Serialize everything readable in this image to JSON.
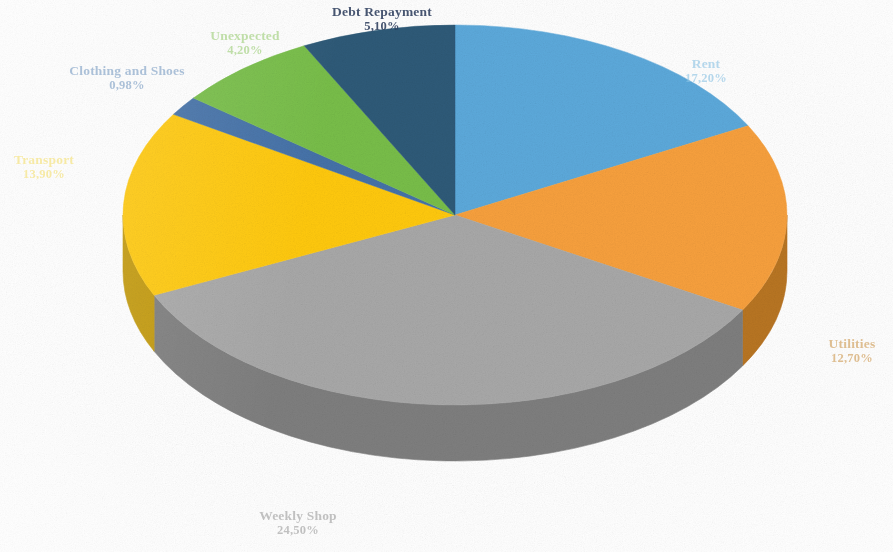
{
  "chart_data": {
    "type": "pie",
    "title": "",
    "subtitle": "",
    "xlabel": "",
    "ylabel": "",
    "legend_position": "none",
    "three_d": true,
    "label_format": "name + percent (comma decimal separator)",
    "categories": [
      "Rent",
      "Utilities",
      "Weekly Shop",
      "Transport",
      "Clothing and Shoes",
      "Unexpected",
      "Debt Repayment"
    ],
    "values": [
      17.2,
      12.7,
      24.5,
      13.9,
      0.98,
      4.2,
      5.1
    ],
    "value_labels": [
      "17,20%",
      "12,70%",
      "24,50%",
      "13,90%",
      "0,98%",
      "4,20%",
      "5,10%"
    ],
    "colors": [
      "#5CA9DB",
      "#F7A03C",
      "#A8A8A8",
      "#FFC910",
      "#4472A8",
      "#78BE4A",
      "#2E5A78"
    ],
    "slices": [
      {
        "name": "Rent",
        "value": 17.2,
        "value_label": "17,20%",
        "color": "#5CA9DB",
        "side_color": "#3E86B4",
        "label_color": "#8CC3E4",
        "sweep_deg": 62,
        "start_deg": -90
      },
      {
        "name": "Utilities",
        "value": 12.7,
        "value_label": "12,70%",
        "color": "#F7A03C",
        "side_color": "#B87424",
        "label_color": "#CE9A52",
        "sweep_deg": 58,
        "start_deg": -28
      },
      {
        "name": "Weekly Shop",
        "value": 24.5,
        "value_label": "24,50%",
        "color": "#A8A8A8",
        "side_color": "#7E7E7E",
        "label_color": "#9E9E9E",
        "sweep_deg": 125,
        "start_deg": 30
      },
      {
        "name": "Transport",
        "value": 13.9,
        "value_label": "13,90%",
        "color": "#FFC910",
        "side_color": "#C39A0C",
        "label_color": "#F2D433",
        "sweep_deg": 57,
        "start_deg": 155
      },
      {
        "name": "Clothing and Shoes",
        "value": 0.98,
        "value_label": "0,98%",
        "color": "#4472A8",
        "side_color": "#32557E",
        "label_color": "#7C9EC4",
        "sweep_deg": 6,
        "start_deg": 212
      },
      {
        "name": "Unexpected",
        "value": 4.2,
        "value_label": "4,20%",
        "color": "#78BE4A",
        "side_color": "#58903A",
        "label_color": "#9DCE78",
        "sweep_deg": 25,
        "start_deg": 218
      },
      {
        "name": "Debt Repayment",
        "value": 5.1,
        "value_label": "5,10%",
        "color": "#2E5A78",
        "side_color": "#21425A",
        "label_color": "#2F3F5E",
        "sweep_deg": 27,
        "start_deg": 243
      }
    ],
    "geometry": {
      "center_x": 455,
      "center_y": 215,
      "radius_x": 332,
      "radius_y": 190,
      "depth": 56
    },
    "background_color": "#FFFFFF"
  }
}
